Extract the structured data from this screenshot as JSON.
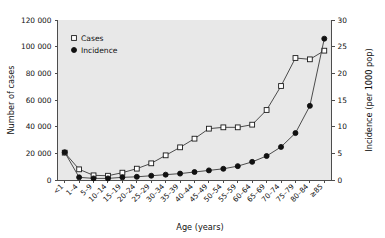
{
  "chart_data": {
    "type": "line",
    "title": "",
    "subtitle": "",
    "xlabel": "Age (years)",
    "ylabel": "Number of cases",
    "y2label": "Incidence (per 1000 pop)",
    "grid": false,
    "legend_position": "top-left",
    "ylim": [
      0,
      120000
    ],
    "y2lim": [
      0,
      30
    ],
    "yticks": [
      "0",
      "20 000",
      "40 000",
      "60 000",
      "80 000",
      "100 000",
      "120 000"
    ],
    "ytick_values": [
      0,
      20000,
      40000,
      60000,
      80000,
      100000,
      120000
    ],
    "y2ticks": [
      "0",
      "5",
      "10",
      "15",
      "20",
      "25",
      "30"
    ],
    "y2tick_values": [
      0,
      5,
      10,
      15,
      20,
      25,
      30
    ],
    "categories": [
      "<1",
      "1–4",
      "5–9",
      "10–14",
      "15–19",
      "20–24",
      "25–29",
      "30–34",
      "35–39",
      "40–44",
      "45–49",
      "50–54",
      "55–59",
      "60–64",
      "65–69",
      "70–74",
      "75–79",
      "80–84",
      "≥85"
    ],
    "series": [
      {
        "name": "Cases",
        "axis": "left",
        "marker": "open-square",
        "values": [
          20500,
          8000,
          3500,
          3200,
          5500,
          8500,
          12500,
          18500,
          24500,
          31000,
          38500,
          39500,
          39500,
          41500,
          52500,
          70500,
          91500,
          90500,
          97000
        ]
      },
      {
        "name": "Incidence",
        "axis": "right",
        "marker": "filled-circle",
        "values": [
          5.2,
          0.5,
          0.3,
          0.3,
          0.5,
          0.6,
          0.8,
          1.0,
          1.2,
          1.5,
          1.8,
          2.1,
          2.6,
          3.4,
          4.5,
          6.2,
          8.8,
          13.9,
          26.5
        ]
      }
    ],
    "legend": [
      {
        "label": "Cases",
        "marker": "open-square"
      },
      {
        "label": "Incidence",
        "marker": "filled-circle"
      }
    ],
    "colors": {
      "plot_background": "#e8e8e8",
      "page_background": "#ffffff",
      "line": "#3a3a3a",
      "axis": "#4d4d4d",
      "text": "#111111",
      "marker_open_fill": "#ffffff",
      "marker_filled_fill": "#111111"
    }
  }
}
